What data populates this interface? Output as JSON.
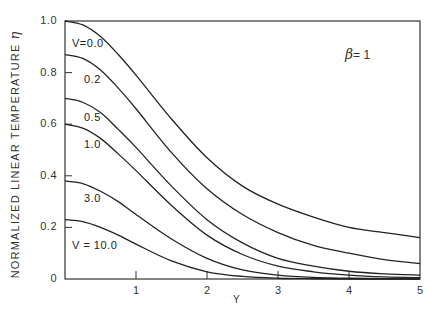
{
  "chart_data": {
    "type": "line",
    "title": "",
    "xlabel": "Y",
    "ylabel": "NORMALIZED LINEAR TEMPERATURE",
    "ylabel_symbol": "η",
    "xlim": [
      0,
      5
    ],
    "ylim": [
      0,
      1.0
    ],
    "grid": false,
    "legend": "inline curve labels",
    "x_ticks": [
      1,
      2,
      3,
      4,
      5
    ],
    "x_tick_labels": [
      "1",
      "2",
      "3",
      "4",
      "5"
    ],
    "y_ticks": [
      0,
      0.2,
      0.4,
      0.6,
      0.8,
      1.0
    ],
    "y_tick_labels": [
      "0",
      "0.2",
      "0.4",
      "0.6",
      "0.8",
      "1.0"
    ],
    "annotation": {
      "symbol": "β",
      "text": "= 1"
    },
    "x": [
      0,
      0.25,
      0.5,
      0.75,
      1.0,
      1.5,
      2.0,
      2.5,
      3.0,
      3.5,
      4.0,
      4.5,
      5.0
    ],
    "series": [
      {
        "name": "V=0.0",
        "label": "V=0.0",
        "values": [
          1.0,
          0.985,
          0.94,
          0.87,
          0.79,
          0.62,
          0.47,
          0.36,
          0.29,
          0.24,
          0.2,
          0.18,
          0.16
        ]
      },
      {
        "name": "V=0.2",
        "label": "0.2",
        "values": [
          0.87,
          0.855,
          0.81,
          0.74,
          0.66,
          0.49,
          0.35,
          0.25,
          0.18,
          0.13,
          0.1,
          0.075,
          0.06
        ]
      },
      {
        "name": "V=0.5",
        "label": "0.5",
        "values": [
          0.7,
          0.685,
          0.645,
          0.58,
          0.51,
          0.36,
          0.23,
          0.14,
          0.08,
          0.05,
          0.03,
          0.02,
          0.015
        ]
      },
      {
        "name": "V=1.0",
        "label": "1.0",
        "values": [
          0.6,
          0.585,
          0.545,
          0.485,
          0.42,
          0.285,
          0.17,
          0.095,
          0.05,
          0.028,
          0.015,
          0.008,
          0.005
        ]
      },
      {
        "name": "V=3.0",
        "label": "3.0",
        "values": [
          0.38,
          0.37,
          0.34,
          0.3,
          0.25,
          0.155,
          0.08,
          0.035,
          0.015,
          0.006,
          0.003,
          0.001,
          0.0
        ]
      },
      {
        "name": "V=10.0",
        "label": "V = 10.0",
        "values": [
          0.23,
          0.222,
          0.2,
          0.17,
          0.135,
          0.07,
          0.028,
          0.01,
          0.003,
          0.001,
          0.0,
          0.0,
          0.0
        ]
      }
    ],
    "label_positions": [
      {
        "x": 72,
        "y": 37
      },
      {
        "x": 84,
        "y": 73
      },
      {
        "x": 84,
        "y": 111
      },
      {
        "x": 84,
        "y": 138
      },
      {
        "x": 84,
        "y": 192
      },
      {
        "x": 72,
        "y": 239
      }
    ]
  }
}
